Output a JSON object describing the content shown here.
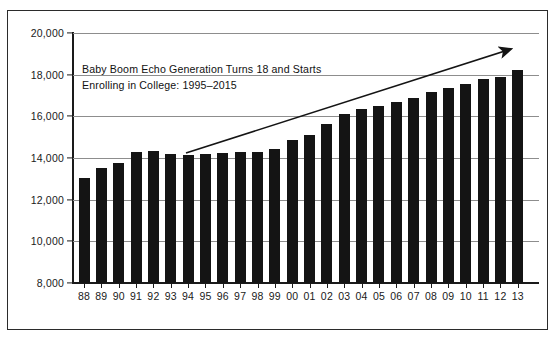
{
  "chart_data": {
    "type": "bar",
    "title": "",
    "subtitle": "",
    "xlabel": "",
    "ylabel": "",
    "categories": [
      "88",
      "89",
      "90",
      "91",
      "92",
      "93",
      "94",
      "95",
      "96",
      "97",
      "98",
      "99",
      "00",
      "01",
      "02",
      "03",
      "04",
      "05",
      "06",
      "07",
      "08",
      "09",
      "10",
      "11",
      "12",
      "13"
    ],
    "values": [
      13080,
      13520,
      13760,
      14290,
      14380,
      14200,
      14190,
      14230,
      14280,
      14330,
      14330,
      14470,
      14900,
      15150,
      15680,
      16150,
      16390,
      16540,
      16710,
      16930,
      17190,
      17390,
      17570,
      17820,
      17950,
      18250
    ],
    "ylim": [
      8000,
      20000
    ],
    "ytick_values": [
      8000,
      10000,
      12000,
      14000,
      16000,
      18000,
      20000
    ],
    "ytick_labels": [
      "8,000",
      "10,000",
      "12,000",
      "14,000",
      "16,000",
      "18,000",
      "20,000"
    ],
    "grid": true,
    "legend": "none",
    "bar_color": "#141414",
    "grid_color": "#8d8d8d",
    "axis_color": "#1a1a1a",
    "annotations": [
      {
        "name": "baby-boom-echo-note",
        "line1": "Baby Boom Echo Generation Turns 18 and Starts",
        "line2": "Enrolling in College: 1995–2015"
      },
      {
        "name": "upward-trend-arrow",
        "type": "arrow",
        "from_category": "94",
        "to_category": "13"
      }
    ]
  }
}
